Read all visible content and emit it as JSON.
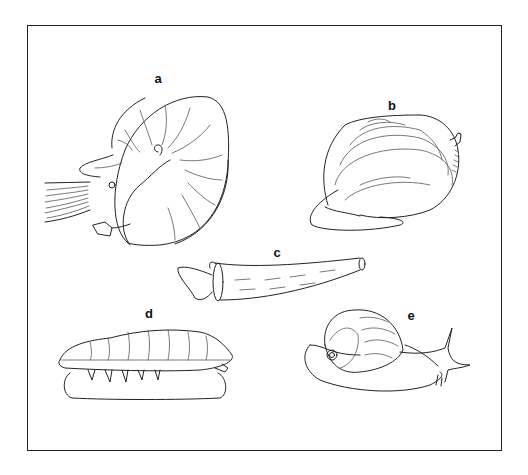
{
  "figure": {
    "panels": [
      {
        "id": "a",
        "label": "a",
        "subject": "nautilus (cephalopod)"
      },
      {
        "id": "b",
        "label": "b",
        "subject": "clam (bivalve)"
      },
      {
        "id": "c",
        "label": "c",
        "subject": "tusk shell (scaphopod)"
      },
      {
        "id": "d",
        "label": "d",
        "subject": "chiton (polyplacophoran)"
      },
      {
        "id": "e",
        "label": "e",
        "subject": "snail (gastropod)"
      }
    ]
  }
}
